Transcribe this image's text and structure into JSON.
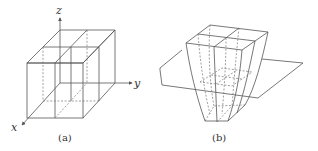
{
  "figure": {
    "panel_a": {
      "caption": "(a)",
      "axes": {
        "x": "x",
        "y": "y",
        "z": "z"
      },
      "description": "Two adjacent rectangular cells (2x1x1 block) on 3D axes"
    },
    "panel_b": {
      "caption": "(b)",
      "description": "Deformed (tapered) pair of cells passing through a horizontal plane"
    },
    "colors": {
      "line": "#555555",
      "hidden_line": "#777777",
      "background": "#ffffff"
    }
  }
}
